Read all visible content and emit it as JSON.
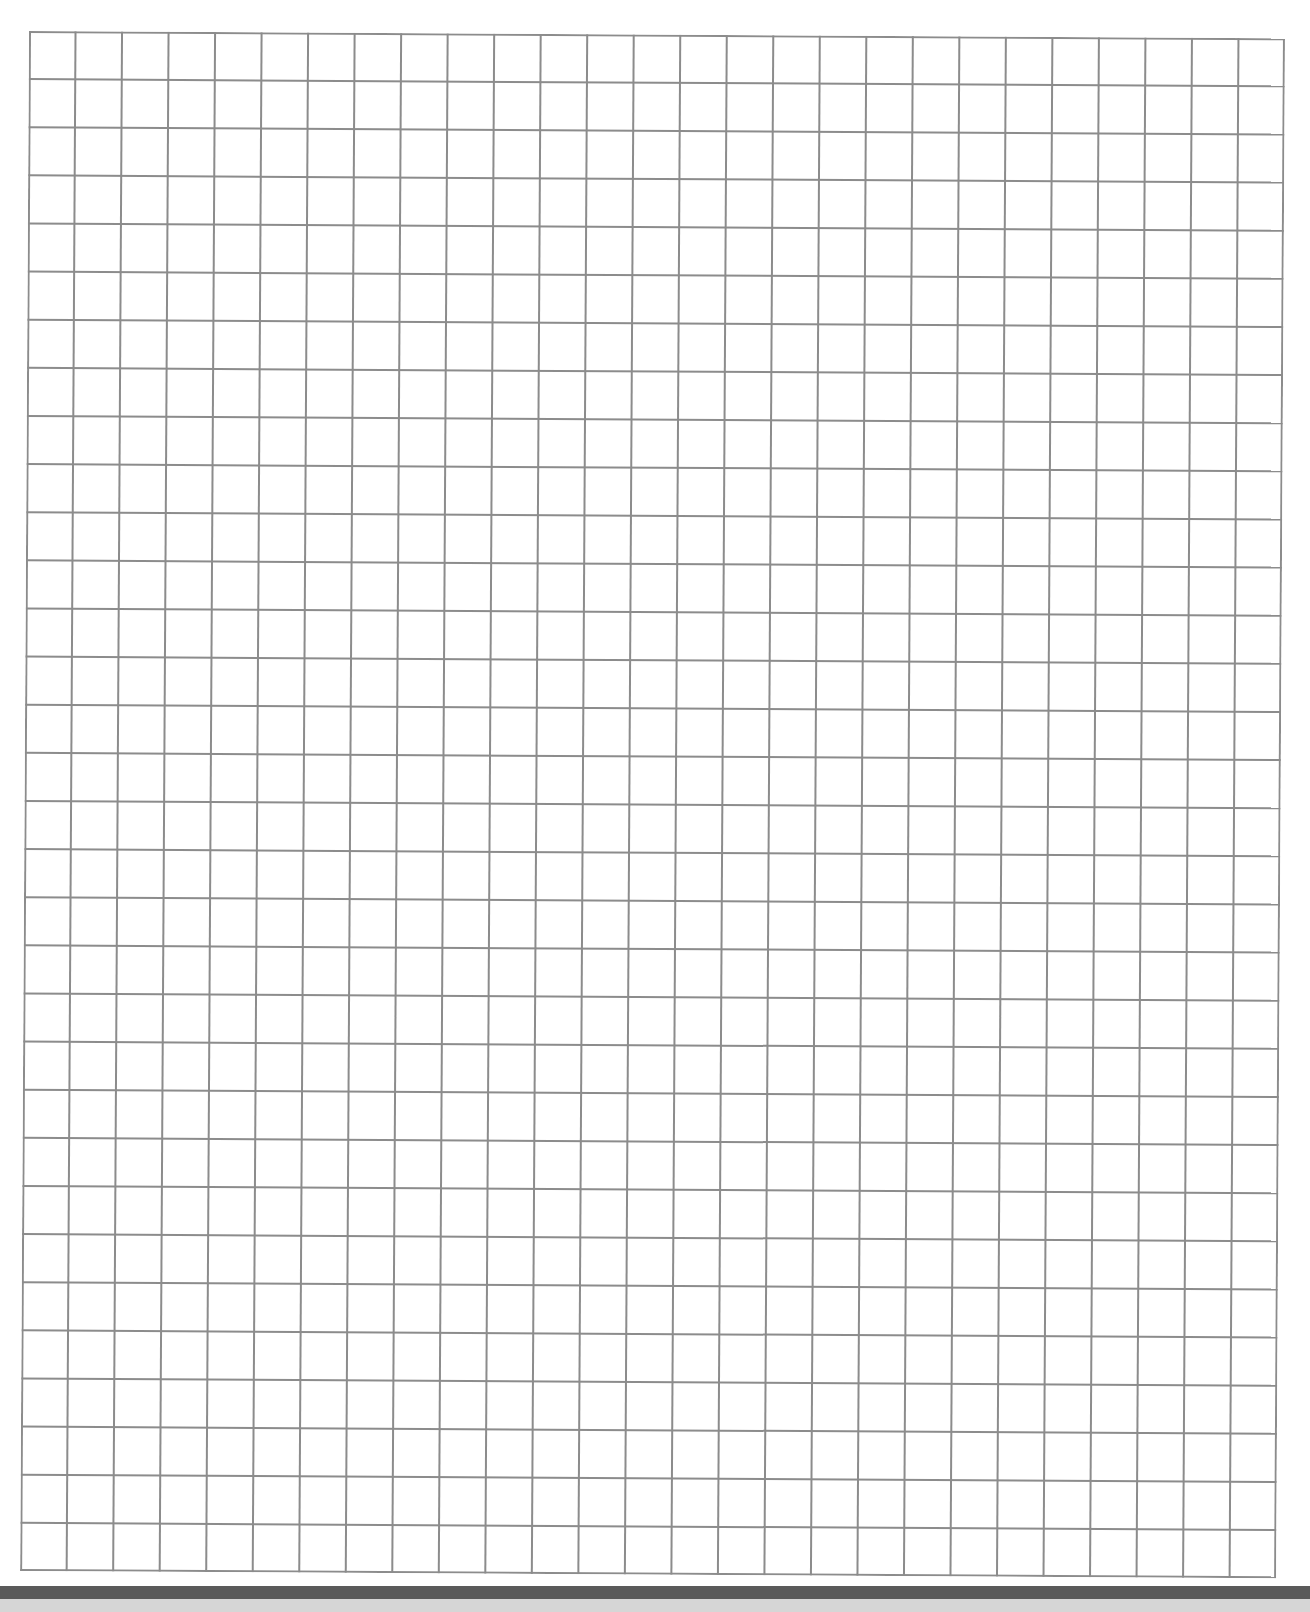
{
  "page": {
    "type": "graph-paper",
    "background_color": "#ffffff"
  },
  "grid": {
    "columns": 27,
    "rows": 32,
    "cell_width_px": 46.5,
    "cell_height_px": 48.1,
    "line_color": "#8c8c8c",
    "line_width_px": 2
  },
  "footer": {
    "bar_color": "#5a5a5a",
    "strip_color": "#d6d6d6"
  }
}
